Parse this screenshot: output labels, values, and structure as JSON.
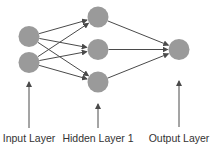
{
  "diagram": {
    "colors": {
      "node": "#9a9a9a",
      "edge": "#4a4a4a",
      "text": "#333333"
    },
    "layers": [
      {
        "id": "input",
        "label": "Input Layer",
        "node_count": 2
      },
      {
        "id": "hidden1",
        "label": "Hidden Layer 1",
        "node_count": 3
      },
      {
        "id": "output",
        "label": "Output Layer",
        "node_count": 1
      }
    ],
    "connections": "fully-connected between consecutive layers"
  }
}
